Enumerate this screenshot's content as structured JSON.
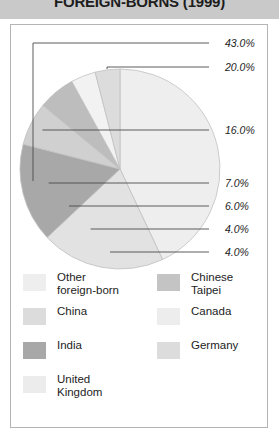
{
  "header": {
    "title": "FOREIGN-BORNS (1999)",
    "band_color": "#c9c9c9"
  },
  "panel": {
    "background": "#ffffff",
    "border_color": "#b4b4b4"
  },
  "chart_data": {
    "type": "pie",
    "title": "FOREIGN-BORNS (1999)",
    "xlabel": "",
    "ylabel": "",
    "grid": false,
    "legend_position": "bottom",
    "value_suffix": "%",
    "categories": [
      "Other foreign-born",
      "Chinese Taipei",
      "China",
      "Canada",
      "India",
      "Germany",
      "United Kingdom"
    ],
    "values": [
      43.0,
      20.0,
      16.0,
      7.0,
      6.0,
      4.0,
      4.0
    ],
    "labels": [
      "43.0%",
      "20.0%",
      "16.0%",
      "7.0%",
      "6.0%",
      "4.0%",
      "4.0%"
    ],
    "colors": [
      "#eeeeee",
      "#e2e2e2",
      "#a8a8a8",
      "#d0d0d0",
      "#bdbdbd",
      "#f2f2f2",
      "#dcdcdc"
    ],
    "slices": [
      {
        "name": "Other foreign-born",
        "value": 43.0,
        "label": "43.0%",
        "color": "#eeeeee"
      },
      {
        "name": "Chinese Taipei",
        "value": 20.0,
        "label": "20.0%",
        "color": "#e2e2e2"
      },
      {
        "name": "China",
        "value": 16.0,
        "label": "16.0%",
        "color": "#a8a8a8"
      },
      {
        "name": "Canada",
        "value": 7.0,
        "label": "7.0%",
        "color": "#d0d0d0"
      },
      {
        "name": "India",
        "value": 6.0,
        "label": "6.0%",
        "color": "#bdbdbd"
      },
      {
        "name": "Germany",
        "value": 4.0,
        "label": "4.0%",
        "color": "#f2f2f2"
      },
      {
        "name": "United Kingdom",
        "value": 4.0,
        "label": "4.0%",
        "color": "#dcdcdc"
      }
    ]
  },
  "callouts": [
    {
      "label": "43.0%",
      "x": 214,
      "y": 18
    },
    {
      "label": "20.0%",
      "x": 214,
      "y": 42
    },
    {
      "label": "16.0%",
      "x": 214,
      "y": 105
    },
    {
      "label": "7.0%",
      "x": 214,
      "y": 158
    },
    {
      "label": "6.0%",
      "x": 214,
      "y": 181
    },
    {
      "label": "4.0%",
      "x": 214,
      "y": 204
    },
    {
      "label": "4.0%",
      "x": 214,
      "y": 227
    }
  ],
  "legend": {
    "left_column": [
      {
        "label": "Other\nforeign-born",
        "color": "#eeeeee"
      },
      {
        "label": "China",
        "color": "#dcdcdc"
      },
      {
        "label": "India",
        "color": "#a8a8a8"
      },
      {
        "label": "United\nKingdom",
        "color": "#ececec"
      }
    ],
    "right_column": [
      {
        "label": "Chinese\nTaipei",
        "color": "#c4c4c4"
      },
      {
        "label": "Canada",
        "color": "#ededed"
      },
      {
        "label": "Germany",
        "color": "#dcdcdc"
      }
    ]
  }
}
